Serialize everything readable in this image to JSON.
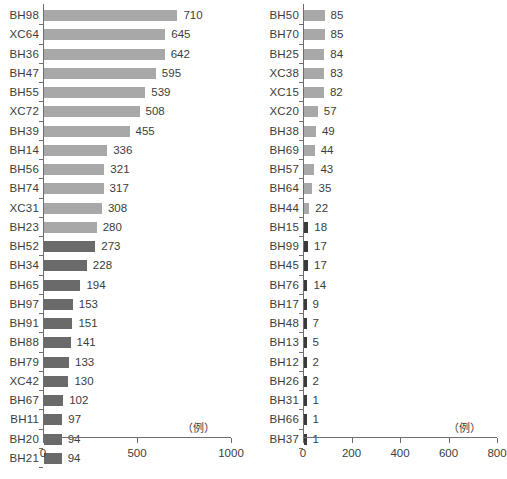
{
  "colors": {
    "bar_light": "#a8a8a8",
    "bar_dark": "#6a6a6a",
    "bar_very_dark": "#3a3a3a",
    "axis": "#6e6e6e",
    "text": "#3c3c3c",
    "background": "#ffffff"
  },
  "units": {
    "left": "（例）",
    "right": "（例）"
  },
  "chart_data": [
    {
      "type": "bar",
      "orientation": "horizontal",
      "title": "",
      "xlabel": "（例）",
      "ylabel": "",
      "xlim": [
        0,
        1000
      ],
      "xticks": [
        0,
        500,
        1000
      ],
      "xtick_labels": [
        "0",
        "500",
        "1000"
      ],
      "grid": false,
      "legend": "none",
      "sort": "descending",
      "categories": [
        "BH98",
        "XC64",
        "BH36",
        "BH47",
        "BH55",
        "XC72",
        "BH39",
        "BH14",
        "BH56",
        "BH74",
        "XC31",
        "BH23",
        "BH52",
        "BH34",
        "BH65",
        "BH97",
        "BH91",
        "BH88",
        "BH79",
        "XC42",
        "BH67",
        "BH11",
        "BH20",
        "BH21"
      ],
      "values": [
        710,
        645,
        642,
        595,
        539,
        508,
        455,
        336,
        321,
        317,
        308,
        280,
        273,
        228,
        194,
        153,
        151,
        141,
        133,
        130,
        102,
        97,
        94,
        94
      ],
      "bar_colors": [
        "#a8a8a8",
        "#a8a8a8",
        "#a8a8a8",
        "#a8a8a8",
        "#a8a8a8",
        "#a8a8a8",
        "#a8a8a8",
        "#a8a8a8",
        "#a8a8a8",
        "#a8a8a8",
        "#a8a8a8",
        "#a8a8a8",
        "#6a6a6a",
        "#6a6a6a",
        "#6a6a6a",
        "#6a6a6a",
        "#6a6a6a",
        "#6a6a6a",
        "#6a6a6a",
        "#6a6a6a",
        "#6a6a6a",
        "#6a6a6a",
        "#6a6a6a",
        "#6a6a6a"
      ]
    },
    {
      "type": "bar",
      "orientation": "horizontal",
      "title": "",
      "xlabel": "（例）",
      "ylabel": "",
      "xlim": [
        0,
        800
      ],
      "xticks": [
        0,
        200,
        400,
        600,
        800
      ],
      "xtick_labels": [
        "0",
        "200",
        "400",
        "600",
        "800"
      ],
      "grid": false,
      "legend": "none",
      "sort": "descending",
      "categories": [
        "BH50",
        "BH70",
        "BH25",
        "XC38",
        "XC15",
        "XC20",
        "BH38",
        "BH69",
        "BH57",
        "BH64",
        "BH44",
        "BH15",
        "BH99",
        "BH45",
        "BH76",
        "BH17",
        "BH48",
        "BH13",
        "BH12",
        "BH26",
        "BH31",
        "BH66",
        "BH37"
      ],
      "values": [
        85,
        85,
        84,
        83,
        82,
        57,
        49,
        44,
        43,
        35,
        22,
        18,
        17,
        17,
        14,
        9,
        7,
        5,
        2,
        2,
        1,
        1,
        1
      ],
      "bar_colors": [
        "#a8a8a8",
        "#a8a8a8",
        "#a8a8a8",
        "#a8a8a8",
        "#a8a8a8",
        "#a8a8a8",
        "#a8a8a8",
        "#a8a8a8",
        "#a8a8a8",
        "#a8a8a8",
        "#a8a8a8",
        "#3a3a3a",
        "#3a3a3a",
        "#3a3a3a",
        "#3a3a3a",
        "#3a3a3a",
        "#3a3a3a",
        "#3a3a3a",
        "#3a3a3a",
        "#3a3a3a",
        "#3a3a3a",
        "#3a3a3a",
        "#3a3a3a"
      ]
    }
  ]
}
